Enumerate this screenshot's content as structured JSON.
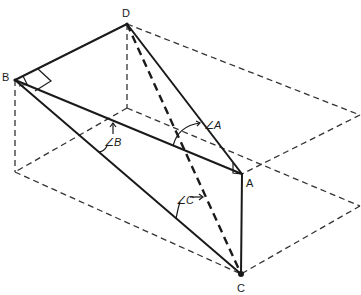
{
  "diagram": {
    "type": "3D geometric figure (tetrahedron inscribed in dashed rectangular box)",
    "vertices": {
      "A": "A",
      "B": "B",
      "C": "C",
      "D": "D"
    },
    "angles": {
      "A": "∠A",
      "B": "∠B",
      "C": "∠C"
    },
    "edges_solid": [
      "BD",
      "BA",
      "BC",
      "DA",
      "AC"
    ],
    "edges_dashed_bold": [
      "DC"
    ],
    "right_angles": [
      "at B (DBA)",
      "at B (DBC)",
      "at A (BAC)"
    ],
    "colors": {
      "line": "#1a1a1a",
      "background": "#ffffff"
    }
  }
}
